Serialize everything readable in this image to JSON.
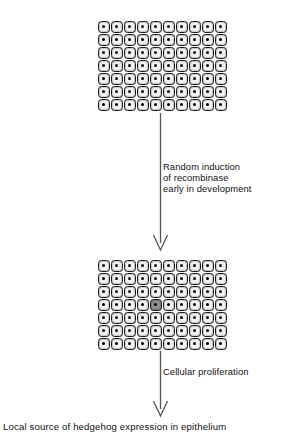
{
  "figure": {
    "background_color": "#ffffff"
  },
  "colors": {
    "cell_fill": "#c9c9c9",
    "cell_outline": "#1a1a1a",
    "cell_halo": "#f2f2f2",
    "nucleus": "#000000",
    "marked_cell_fill": "#7a7a7a",
    "marked_cell_halo": "#8f8f8f",
    "arrow": "#555555",
    "text": "#111111"
  },
  "sheets": [
    {
      "id": "epithelium-sheet-top",
      "name": "epithelial-sheet-unmarked",
      "columns": 10,
      "rows": 7,
      "cell_size_px": 13,
      "marked_cells": [],
      "description": "Uniform sheet of epithelial cells before recombination"
    },
    {
      "id": "epithelium-sheet-bottom",
      "name": "epithelial-sheet-marked",
      "columns": 10,
      "rows": 7,
      "cell_size_px": 13,
      "marked_cells": [
        {
          "row": 3,
          "col": 4
        }
      ],
      "description": "Sheet with a single randomly recombinase-induced cell"
    }
  ],
  "steps": [
    {
      "id": "step-1",
      "name": "random-induction",
      "lines": [
        "Random induction",
        "of recombinase",
        "early in development"
      ],
      "text": "Random induction\nof recombinase\nearly in development"
    },
    {
      "id": "step-2",
      "name": "cellular-proliferation",
      "lines": [
        "Cellular proliferation"
      ],
      "text": "Cellular proliferation"
    }
  ],
  "caption": {
    "text": "Local source of hedgehog expression in epithelium"
  },
  "arrows": [
    {
      "id": "arrow-1",
      "name": "arrow-induction",
      "direction": "down"
    },
    {
      "id": "arrow-2",
      "name": "arrow-proliferation",
      "direction": "down"
    },
    {
      "id": "arrow-3",
      "name": "arrow-to-caption",
      "direction": "down"
    }
  ]
}
